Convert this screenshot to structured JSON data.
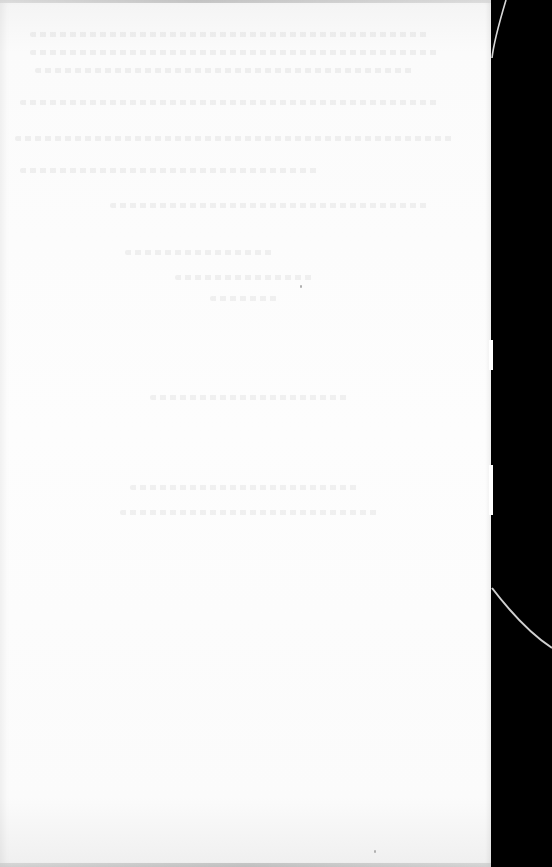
{
  "document": {
    "type": "scanned-page",
    "background_color": "#000000",
    "paper_color": "#fdfdfd",
    "visible_text": "",
    "note": ""
  },
  "ghost_lines": [
    {
      "top": 32,
      "left": 30,
      "width": 400
    },
    {
      "top": 50,
      "left": 30,
      "width": 410
    },
    {
      "top": 68,
      "left": 35,
      "width": 380
    },
    {
      "top": 100,
      "left": 20,
      "width": 420
    },
    {
      "top": 136,
      "left": 15,
      "width": 440
    },
    {
      "top": 168,
      "left": 20,
      "width": 300
    },
    {
      "top": 203,
      "left": 110,
      "width": 320
    },
    {
      "top": 250,
      "left": 125,
      "width": 150
    },
    {
      "top": 275,
      "left": 175,
      "width": 140
    },
    {
      "top": 296,
      "left": 210,
      "width": 70
    },
    {
      "top": 395,
      "left": 150,
      "width": 200
    },
    {
      "top": 485,
      "left": 130,
      "width": 230
    },
    {
      "top": 510,
      "left": 120,
      "width": 260
    }
  ]
}
